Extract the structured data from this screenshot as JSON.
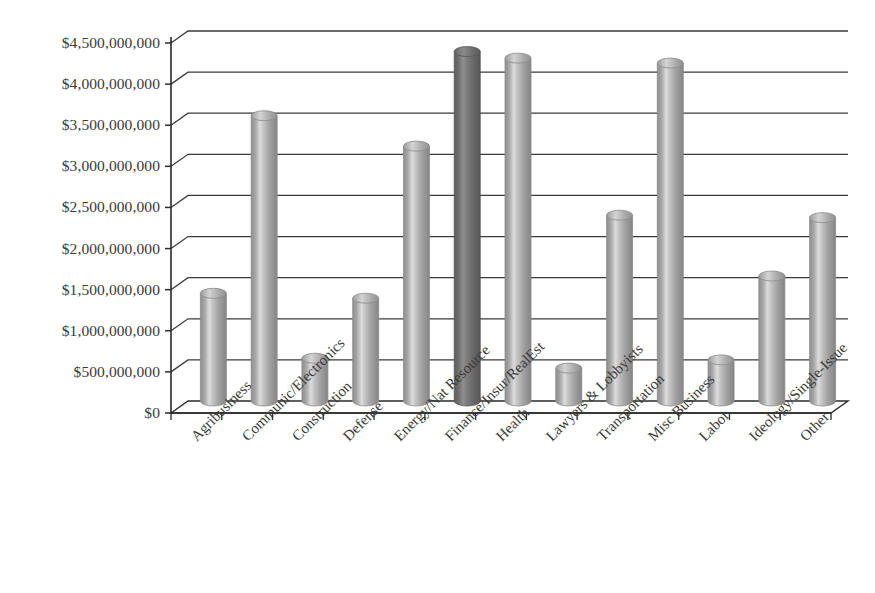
{
  "chart_data": {
    "type": "bar",
    "title": "",
    "subtitle": "",
    "xlabel": "",
    "ylabel": "",
    "ylim": [
      0,
      4500000000
    ],
    "ytick_step": 500000000,
    "grid": true,
    "legend": "none",
    "style": "3d-cylinder",
    "currency_prefix": "$",
    "ytick_labels": [
      "$4,500,000,000",
      "$4,000,000,000",
      "$3,500,000,000",
      "$3,000,000,000",
      "$2,500,000,000",
      "$2,000,000,000",
      "$1,500,000,000",
      "$1,000,000,000",
      "$500,000,000",
      "$0"
    ],
    "ytick_values": [
      4500000000,
      4000000000,
      3500000000,
      3000000000,
      2500000000,
      2000000000,
      1500000000,
      1000000000,
      500000000,
      0
    ],
    "categories": [
      "Agribusiness",
      "Communic/Electronics",
      "Construction",
      "Defense",
      "Energy/Nat Resource",
      "Finance/Insur/RealEst",
      "Health",
      "Lawyers & Lobbyists",
      "Transportation",
      "Misc Business",
      "Labor",
      "Ideology/Single-Issue",
      "Other"
    ],
    "values": [
      1310000000,
      3470000000,
      520000000,
      1250000000,
      3100000000,
      4250000000,
      4170000000,
      400000000,
      2260000000,
      4110000000,
      500000000,
      1520000000,
      2230000000
    ],
    "highlight_index": 5,
    "colors": {
      "bar_light_mid": "#a8a8a8",
      "bar_light_highlight": "#e3e3e3",
      "bar_light_shadow": "#8c8c8c",
      "bar_dark_mid": "#6f6f6f",
      "bar_dark_highlight": "#9a9a9a",
      "bar_dark_shadow": "#575757",
      "grid": "#3a3a3a",
      "axis": "#2b2b2b",
      "background": "#ffffff",
      "text": "#3a3a3a"
    }
  }
}
